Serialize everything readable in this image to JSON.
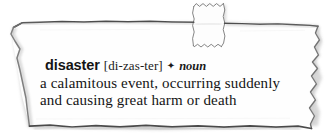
{
  "artwork": {
    "kind": "torn-paper-dictionary-clipping",
    "background_color": "#ffffff",
    "paper_color": "#fefefe",
    "tear_edge_color": "#5a5a5a",
    "shadow_color": "#b8b8b8",
    "tab_label": "torn-paper-tab"
  },
  "entry": {
    "headword": "disaster",
    "pronunciation": "[di-zas-ter]",
    "separator_glyph": "✦",
    "separator_icon_name": "diamond-bullet-icon",
    "part_of_speech": "noun",
    "definition_lines": [
      "a calamitous event, occurring suddenly",
      "and causing great harm or death"
    ],
    "definition_full": "a calamitous event, occurring suddenly and causing great harm or death",
    "text_color": "#141414"
  }
}
